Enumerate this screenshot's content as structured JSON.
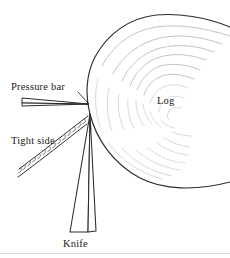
{
  "figure": {
    "kind": "rotary-veneer-lathe-schematic",
    "background_color": "#ffffff",
    "ink_color": "#2b2b2b",
    "ring_color": "#b9b9bd",
    "width": 230,
    "height": 258
  },
  "labels": {
    "pressure_bar": "Pressure bar",
    "tight_side": "Tight side",
    "log": "Log",
    "knife": "Knife"
  },
  "components": {
    "log": {
      "name": "Log",
      "description": "Large circular log cross-section, partially off the right edge",
      "center_x": 186,
      "center_y": 100,
      "radius": 96,
      "growth_ring_count": 9
    },
    "knife": {
      "name": "Knife",
      "description": "Narrow wedge with cutting apex at the log surface",
      "apex_x": 90,
      "apex_y": 114
    },
    "pressure_bar": {
      "name": "Pressure bar",
      "description": "Thin tapered bar contacting the log just above the knife apex",
      "tip_x": 89,
      "tip_y": 104
    },
    "veneer": {
      "name": "Veneer sheet",
      "description": "Peeled veneer ribbon leaving the knife toward the lower left",
      "check_count": 14
    }
  }
}
